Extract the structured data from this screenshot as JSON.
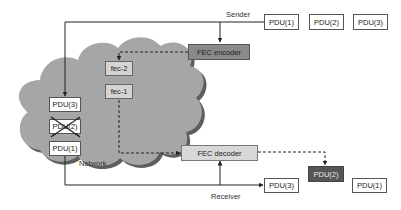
{
  "diagram": {
    "title": "",
    "network": {
      "label": "Network",
      "color": "#a6a6a6"
    },
    "sender": {
      "label": "Sender",
      "pdus": [
        {
          "label": "PDU(1)"
        },
        {
          "label": "PDU(2)"
        },
        {
          "label": "PDU(3)"
        }
      ]
    },
    "fec_encoder": {
      "label": "FEC encoder",
      "color": "#8a8a8a"
    },
    "fec_packets": [
      {
        "label": "fec-2"
      },
      {
        "label": "fec-1"
      }
    ],
    "network_pdus": [
      {
        "label": "PDU(3)",
        "lost": false
      },
      {
        "label": "PDU(2)",
        "lost": true
      },
      {
        "label": "PDU(1)",
        "lost": false
      }
    ],
    "fec_decoder": {
      "label": "FEC decoder",
      "color": "#d8d8d8"
    },
    "receiver": {
      "label": "Receiver",
      "received_pdus": [
        {
          "label": "PDU(3)"
        },
        {
          "label": "PDU(1)"
        }
      ],
      "recovered_pdu": {
        "label": "PDU(2)",
        "color": "#555555"
      }
    }
  }
}
